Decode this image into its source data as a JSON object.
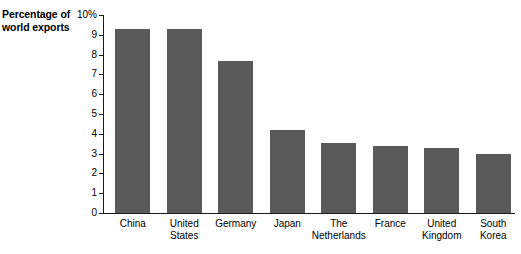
{
  "chart_data": {
    "type": "bar",
    "title": "",
    "subtitle": "",
    "xlabel": "",
    "ylabel": "Percentage of world exports",
    "ylabel_lines": [
      "Percentage of",
      "world exports"
    ],
    "categories": [
      "China",
      "United States",
      "Germany",
      "Japan",
      "The Netherlands",
      "France",
      "United Kingdom",
      "South Korea"
    ],
    "category_lines": [
      [
        "China"
      ],
      [
        "United",
        "States"
      ],
      [
        "Germany"
      ],
      [
        "Japan"
      ],
      [
        "The",
        "Netherlands"
      ],
      [
        "France"
      ],
      [
        "United",
        "Kingdom"
      ],
      [
        "South",
        "Korea"
      ]
    ],
    "values": [
      9.3,
      9.3,
      7.7,
      4.2,
      3.55,
      3.4,
      3.3,
      3.0
    ],
    "ylim": [
      0,
      10
    ],
    "ytick_values": [
      0,
      1,
      2,
      3,
      4,
      5,
      6,
      7,
      8,
      9,
      10
    ],
    "ytick_labels": [
      "0",
      "1",
      "2",
      "3",
      "4",
      "5",
      "6",
      "7",
      "8",
      "9",
      "10%"
    ],
    "grid": false,
    "legend": false,
    "legend_position": "none",
    "bar_color": "#5a5a5a",
    "axis_color": "#1a1a1a",
    "background_color": "#ffffff"
  }
}
